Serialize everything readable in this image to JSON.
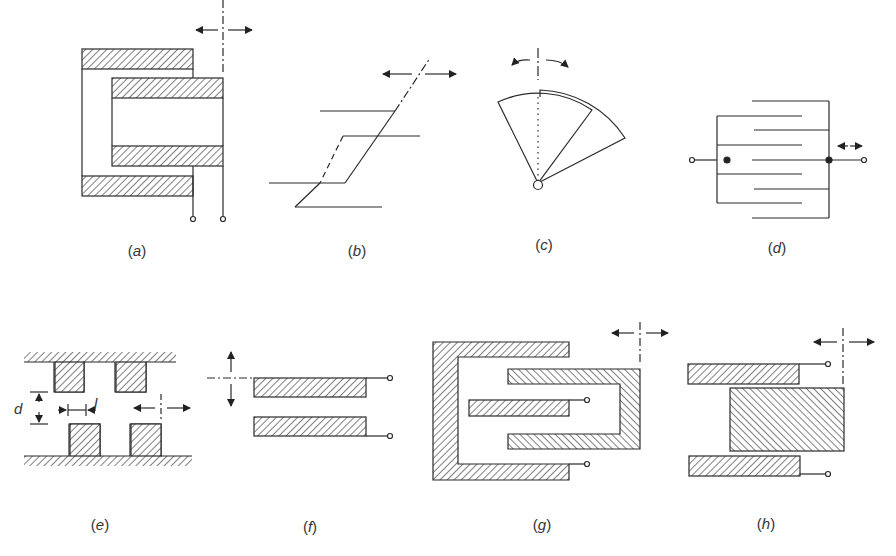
{
  "figure": {
    "type": "capacitive sensor electrode configurations",
    "colors": {
      "stroke": "#2a2a2a",
      "background": "#ffffff",
      "label": "#333333"
    },
    "panels": [
      {
        "id": "a",
        "label": "(a)",
        "open": "(",
        "letter": "a",
        "close": ")",
        "description": "coaxial cylinder, axial displacement"
      },
      {
        "id": "b",
        "label": "(b)",
        "open": "(",
        "letter": "b",
        "close": ")",
        "description": "skewed parallel plate, lateral displacement"
      },
      {
        "id": "c",
        "label": "(c)",
        "open": "(",
        "letter": "c",
        "close": ")",
        "description": "rotary sector plates, angular displacement"
      },
      {
        "id": "d",
        "label": "(d)",
        "open": "(",
        "letter": "d",
        "close": ")",
        "description": "interdigitated comb plates"
      },
      {
        "id": "e",
        "label": "(e)",
        "open": "(",
        "letter": "e",
        "close": ")",
        "description": "toothed plates",
        "dim_gap": "d",
        "dim_tooth": "l"
      },
      {
        "id": "f",
        "label": "(f)",
        "open": "(",
        "letter": "f",
        "close": ")",
        "description": "parallel plates, gap variation"
      },
      {
        "id": "g",
        "label": "(g)",
        "open": "(",
        "letter": "g",
        "close": ")",
        "description": "differential interleaved electrodes"
      },
      {
        "id": "h",
        "label": "(h)",
        "open": "(",
        "letter": "h",
        "close": ")",
        "description": "differential slider between two plates"
      }
    ]
  }
}
